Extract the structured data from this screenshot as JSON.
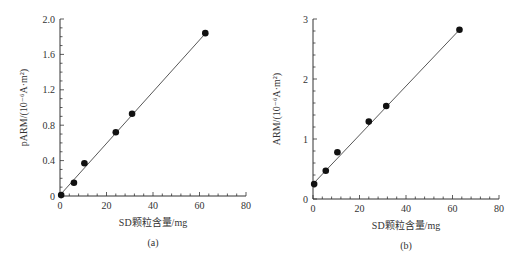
{
  "chart_data": [
    {
      "type": "scatter",
      "panel": "(a)",
      "title": "",
      "xlabel": "SD颗粒含量/mg",
      "ylabel": "pARM/(10⁻⁶A·m²)",
      "xlim": [
        0,
        80
      ],
      "ylim": [
        0,
        2.0
      ],
      "xticks": [
        "0",
        "20",
        "40",
        "60",
        "80"
      ],
      "yticks": [
        "0",
        "0.4",
        "0.8",
        "1.2",
        "1.6",
        "2.0"
      ],
      "grid": false,
      "legend": null,
      "series": [
        {
          "name": "data",
          "x": [
            0.5,
            6,
            10.5,
            24,
            31,
            62.5
          ],
          "y": [
            0.01,
            0.15,
            0.37,
            0.72,
            0.93,
            1.84
          ]
        }
      ],
      "fit_line": {
        "x": [
          0,
          63
        ],
        "y": [
          0.01,
          1.85
        ]
      }
    },
    {
      "type": "scatter",
      "panel": "(b)",
      "title": "",
      "xlabel": "SD颗粒含量/mg",
      "ylabel": "ARM/(10⁻⁶A·m²)",
      "xlim": [
        0,
        80
      ],
      "ylim": [
        0,
        3
      ],
      "xticks": [
        "0",
        "20",
        "40",
        "60",
        "80"
      ],
      "yticks": [
        "0",
        "1",
        "2",
        "3"
      ],
      "grid": false,
      "legend": null,
      "series": [
        {
          "name": "data",
          "x": [
            0.5,
            5.5,
            10.5,
            24,
            31.5,
            63
          ],
          "y": [
            0.25,
            0.47,
            0.78,
            1.29,
            1.55,
            2.82
          ]
        }
      ],
      "fit_line": {
        "x": [
          0.5,
          63
        ],
        "y": [
          0.27,
          2.82
        ]
      }
    }
  ],
  "panels": {
    "a": {
      "label": "(a)",
      "xlabel": "SD颗粒含量/mg",
      "ylabel": "pARM/(10⁻⁶A·m²)"
    },
    "b": {
      "label": "(b)",
      "xlabel": "SD颗粒含量/mg",
      "ylabel": "ARM/(10⁻⁶A·m²)"
    }
  }
}
